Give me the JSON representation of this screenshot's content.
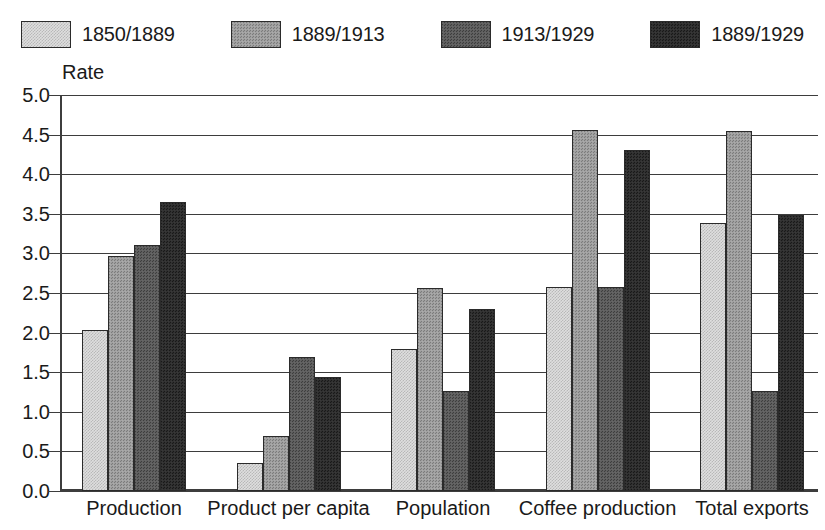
{
  "chart_data": {
    "type": "bar",
    "title": "",
    "subtitle": "",
    "xlabel": "",
    "ylabel": "Rate",
    "ylim": [
      0.0,
      5.0
    ],
    "ytick_step": 0.5,
    "ytick_labels": [
      "0.0",
      "0.5",
      "1.0",
      "1.5",
      "2.0",
      "2.5",
      "3.0",
      "3.5",
      "4.0",
      "4.5",
      "5.0"
    ],
    "grid": true,
    "legend_position": "top",
    "categories": [
      "Production",
      "Product per capita",
      "Population",
      "Coffee production",
      "Total exports"
    ],
    "series": [
      {
        "name": "1850/1889",
        "color": "#dedede",
        "values": [
          2.03,
          0.35,
          1.79,
          2.58,
          3.38
        ]
      },
      {
        "name": "1889/1913",
        "color": "#9c9c9c",
        "values": [
          2.97,
          0.7,
          2.56,
          4.56,
          4.54
        ]
      },
      {
        "name": "1913/1929",
        "color": "#5c5c5c",
        "values": [
          3.1,
          1.69,
          1.26,
          2.58,
          1.26
        ]
      },
      {
        "name": "1889/1929",
        "color": "#2d2d2d",
        "values": [
          3.65,
          1.44,
          2.3,
          4.3,
          3.48
        ]
      }
    ]
  },
  "legend": {
    "items": [
      {
        "label": "1850/1889"
      },
      {
        "label": "1889/1913"
      },
      {
        "label": "1913/1929"
      },
      {
        "label": "1889/1929"
      }
    ]
  },
  "axis": {
    "y_title": "Rate"
  }
}
